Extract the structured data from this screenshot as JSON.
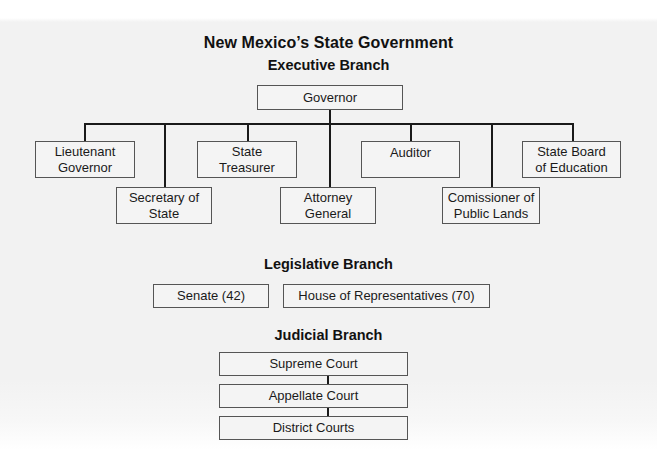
{
  "title": "New Mexico’s State Government",
  "executive": {
    "heading": "Executive Branch",
    "head": "Governor",
    "offices": [
      {
        "line1": "Lieutenant",
        "line2": "Governor"
      },
      {
        "line1": "Secretary of",
        "line2": "State"
      },
      {
        "line1": "State",
        "line2": "Treasurer"
      },
      {
        "line1": "Attorney",
        "line2": "General"
      },
      {
        "line1": "Auditor",
        "line2": ""
      },
      {
        "line1": "Comissioner of",
        "line2": "Public Lands"
      },
      {
        "line1": "State Board",
        "line2": "of Education"
      }
    ]
  },
  "legislative": {
    "heading": "Legislative Branch",
    "chambers": [
      "Senate (42)",
      "House of Representatives (70)"
    ]
  },
  "judicial": {
    "heading": "Judicial Branch",
    "courts": [
      "Supreme Court",
      "Appellate Court",
      "District Courts"
    ]
  },
  "colors": {
    "background": "#f2f2f2",
    "box_border": "#555555",
    "box_fill": "#f4f4f4",
    "lines": "#1a1a1a",
    "text": "#1a1a1a"
  }
}
